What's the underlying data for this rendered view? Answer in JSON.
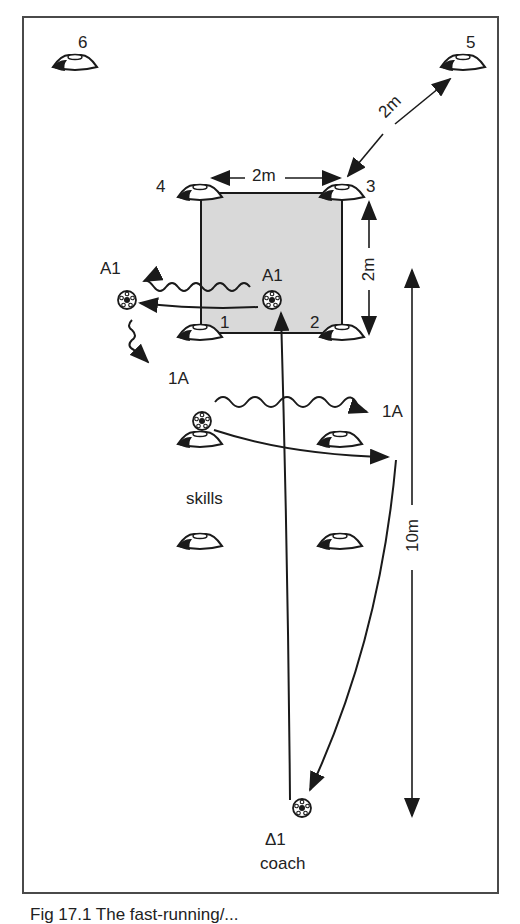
{
  "figure": {
    "caption": "Fig 17.1  The fast-running/...",
    "colors": {
      "grid_fill": "#d9d9d9",
      "ink": "#1a1a1a",
      "border": "#4a4a4a"
    }
  },
  "labels": {
    "cone_6": "6",
    "cone_5": "5",
    "cone_4": "4",
    "cone_3": "3",
    "cone_1": "1",
    "cone_2": "2",
    "dist_top": "2m",
    "dist_diag": "2m",
    "dist_right": "2m",
    "dist_long": "10m",
    "player_a1_inside": "A1",
    "player_a1_outside": "A1",
    "player_1a_left": "1A",
    "player_1a_right": "1A",
    "area_skills": "skills",
    "coach_symbol": "Δ1",
    "coach_text": "coach"
  },
  "elements": {
    "cones": [
      {
        "id": "6",
        "x": 75,
        "y": 63
      },
      {
        "id": "5",
        "x": 463,
        "y": 63
      },
      {
        "id": "4",
        "x": 200,
        "y": 193
      },
      {
        "id": "3",
        "x": 342,
        "y": 193
      },
      {
        "id": "1",
        "x": 200,
        "y": 333
      },
      {
        "id": "2",
        "x": 342,
        "y": 333
      },
      {
        "id": "skills-tl",
        "x": 200,
        "y": 440
      },
      {
        "id": "skills-tr",
        "x": 340,
        "y": 440
      },
      {
        "id": "skills-bl",
        "x": 200,
        "y": 542
      },
      {
        "id": "skills-br",
        "x": 340,
        "y": 542
      }
    ],
    "balls": [
      {
        "id": "a1-inside",
        "x": 272,
        "y": 300
      },
      {
        "id": "a1-outside",
        "x": 127,
        "y": 300
      },
      {
        "id": "skills",
        "x": 202,
        "y": 421
      },
      {
        "id": "coach",
        "x": 302,
        "y": 808
      }
    ]
  }
}
